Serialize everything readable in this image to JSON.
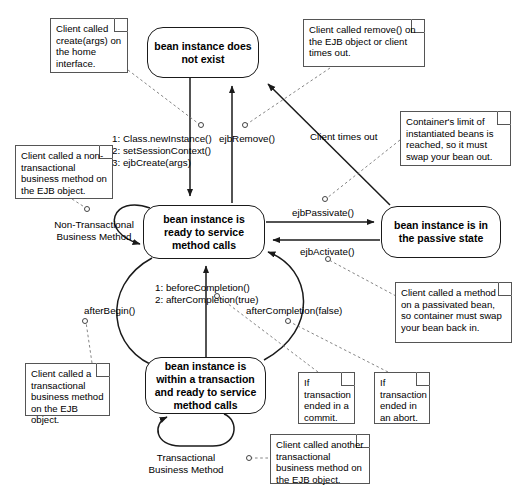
{
  "diagram": {
    "type": "uml-state-diagram",
    "width": 518,
    "height": 497,
    "colors": {
      "background": "#ffffff",
      "state_border": "#1a1a1a",
      "note_border": "#555555",
      "edge": "#1a1a1a",
      "anchor_dash": "#666666",
      "text": "#000000"
    }
  },
  "states": [
    {
      "id": "does-not-exist",
      "label": "bean instance does not exist",
      "x": 147,
      "y": 27,
      "w": 112,
      "h": 51
    },
    {
      "id": "ready",
      "label": "bean instance is ready to service method calls",
      "x": 143,
      "y": 205,
      "w": 122,
      "h": 54
    },
    {
      "id": "passive",
      "label": "bean instance is in the passive state",
      "x": 381,
      "y": 206,
      "w": 120,
      "h": 52
    },
    {
      "id": "in-transaction",
      "label": "bean instance is within a transaction and ready to service method calls",
      "x": 145,
      "y": 357,
      "w": 121,
      "h": 57
    }
  ],
  "edge_labels": [
    {
      "id": "create-sequence",
      "text": "1: Class.newInstance()\n2: setSessionContext()\n3: ejbCreate(args)",
      "x": 112,
      "y": 133,
      "align": "left"
    },
    {
      "id": "ejb-remove",
      "text": "ejbRemove()",
      "x": 219,
      "y": 133,
      "align": "left"
    },
    {
      "id": "client-times-out",
      "text": "Client times out",
      "x": 310,
      "y": 131,
      "align": "left"
    },
    {
      "id": "ejb-passivate",
      "text": "ejbPassivate()",
      "x": 292,
      "y": 207,
      "align": "left"
    },
    {
      "id": "ejb-activate",
      "text": "ejbActivate()",
      "x": 300,
      "y": 246,
      "align": "left"
    },
    {
      "id": "non-transactional-business-method",
      "text": "Non-Transactional\nBusiness Method",
      "x": 53,
      "y": 219,
      "align": "center"
    },
    {
      "id": "completion-sequence",
      "text": "1: beforeCompletion()\n2: afterCompletion(true)",
      "x": 155,
      "y": 282,
      "align": "left"
    },
    {
      "id": "after-begin",
      "text": "afterBegin()",
      "x": 84,
      "y": 305,
      "align": "left"
    },
    {
      "id": "after-completion-false",
      "text": "afterCompletion(false)",
      "x": 246,
      "y": 305,
      "align": "left"
    },
    {
      "id": "transactional-business-method",
      "text": "Transactional\nBusiness Method",
      "x": 146,
      "y": 452,
      "align": "center"
    }
  ],
  "notes": [
    {
      "id": "note-create",
      "text": "Client called create(args) on the home interface.",
      "x": 50,
      "y": 18,
      "w": 78,
      "h": 55
    },
    {
      "id": "note-remove",
      "text": "Client called remove() on the EJB object or client times out.",
      "x": 303,
      "y": 19,
      "w": 122,
      "h": 48
    },
    {
      "id": "note-container-limit",
      "text": "Container's limit of instantiated beans is reached, so it must swap your bean out.",
      "x": 400,
      "y": 111,
      "w": 111,
      "h": 55
    },
    {
      "id": "note-non-transactional",
      "text": "Client called a non-transactional business method on the EJB object.",
      "x": 15,
      "y": 145,
      "w": 98,
      "h": 54
    },
    {
      "id": "note-passivated-bean",
      "text": "Client called a method on a passivated bean, so container must swap your bean back in.",
      "x": 395,
      "y": 282,
      "w": 117,
      "h": 61
    },
    {
      "id": "note-transactional",
      "text": "Client called a transactional business method on the EJB object.",
      "x": 25,
      "y": 363,
      "w": 85,
      "h": 53
    },
    {
      "id": "note-commit",
      "text": "If transaction ended in a commit.",
      "x": 298,
      "y": 372,
      "w": 57,
      "h": 52
    },
    {
      "id": "note-abort",
      "text": "If transaction ended in an abort.",
      "x": 374,
      "y": 372,
      "w": 56,
      "h": 52
    },
    {
      "id": "note-another-transactional",
      "text": "Client called another transactional business method on the EJB object.",
      "x": 270,
      "y": 434,
      "w": 100,
      "h": 50
    }
  ],
  "anchors": [
    {
      "id": "anchor-create",
      "x": 201,
      "y": 125
    },
    {
      "id": "anchor-remove",
      "x": 245,
      "y": 125
    },
    {
      "id": "anchor-passivate",
      "x": 324,
      "y": 199
    },
    {
      "id": "anchor-activate",
      "x": 327,
      "y": 258
    },
    {
      "id": "anchor-non-transactional",
      "x": 87,
      "y": 209
    },
    {
      "id": "anchor-after-begin",
      "x": 85,
      "y": 321
    },
    {
      "id": "anchor-completion",
      "x": 217,
      "y": 295
    },
    {
      "id": "anchor-after-completion-false",
      "x": 288,
      "y": 320
    },
    {
      "id": "anchor-transactional-method",
      "x": 248,
      "y": 458
    }
  ]
}
